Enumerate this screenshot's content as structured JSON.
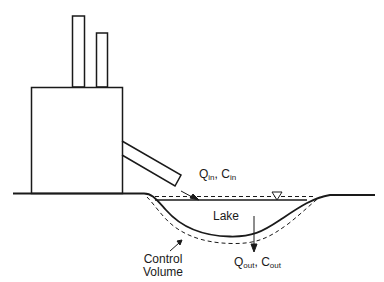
{
  "diagram": {
    "title": "",
    "labels": {
      "inflow_q": "Q",
      "inflow_q_sub": "in",
      "inflow_sep": ", ",
      "inflow_c": "C",
      "inflow_c_sub": "in",
      "lake": "Lake",
      "control_line1": "Control",
      "control_line2": "Volume",
      "outflow_q": "Q",
      "outflow_q_sub": "out",
      "outflow_sep": ", ",
      "outflow_c": "C",
      "outflow_c_sub": "out"
    },
    "elements": [
      "factory-building",
      "smokestack-tall",
      "smokestack-short",
      "discharge-pipe",
      "ground-line",
      "lake-water-surface",
      "water-level-symbol",
      "lake-bed",
      "control-volume-boundary",
      "inflow-arrow",
      "outflow-arrow",
      "control-volume-pointer"
    ],
    "colors": {
      "stroke": "#1a1a1a",
      "background": "#ffffff"
    }
  }
}
